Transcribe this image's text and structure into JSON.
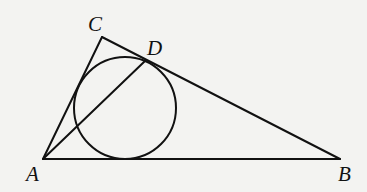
{
  "figure": {
    "background": "#f3f3f1",
    "stroke_color": "#111111",
    "points": {
      "A": {
        "label": "A",
        "x": 43,
        "y": 159
      },
      "B": {
        "label": "B",
        "x": 340,
        "y": 159
      },
      "C": {
        "label": "C",
        "x": 102,
        "y": 37
      },
      "D": {
        "label": "D",
        "x": 145,
        "y": 61
      }
    },
    "circle": {
      "cx": 125,
      "cy": 108,
      "r": 51
    },
    "segments": [
      {
        "from": "A",
        "to": "B"
      },
      {
        "from": "A",
        "to": "C"
      },
      {
        "from": "C",
        "to": "B"
      },
      {
        "from": "A",
        "to": "D"
      }
    ],
    "labels": {
      "A": "A",
      "B": "B",
      "C": "C",
      "D": "D"
    }
  }
}
